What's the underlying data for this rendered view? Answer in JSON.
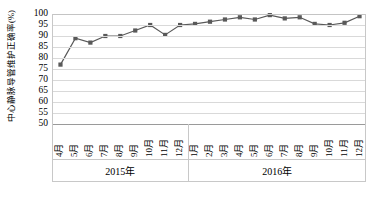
{
  "chart_data": {
    "type": "line",
    "title": "",
    "xlabel": "",
    "ylabel": "中心静脉导管维护正确率(%)",
    "ylim": [
      50,
      100
    ],
    "ytick_step": 5,
    "yticks": [
      "100",
      "95",
      "90",
      "85",
      "80",
      "75",
      "70",
      "65",
      "60",
      "55",
      "50"
    ],
    "grid": true,
    "legend": "none",
    "series_color": "#595959",
    "marker": "square",
    "categories": [
      "4月",
      "5月",
      "6月",
      "7月",
      "8月",
      "9月",
      "10月",
      "11月",
      "12月",
      "1月",
      "2月",
      "3月",
      "4月",
      "5月",
      "6月",
      "7月",
      "8月",
      "9月",
      "10月",
      "11月",
      "12月"
    ],
    "groups": [
      {
        "label": "2015年",
        "count": 9
      },
      {
        "label": "2016年",
        "count": 12
      }
    ],
    "values": [
      77,
      89,
      87,
      90,
      90,
      92.5,
      95,
      90.5,
      95,
      95.5,
      96.5,
      97.5,
      98.5,
      97.5,
      99.5,
      98,
      98.5,
      95.5,
      95,
      96,
      99
    ]
  }
}
